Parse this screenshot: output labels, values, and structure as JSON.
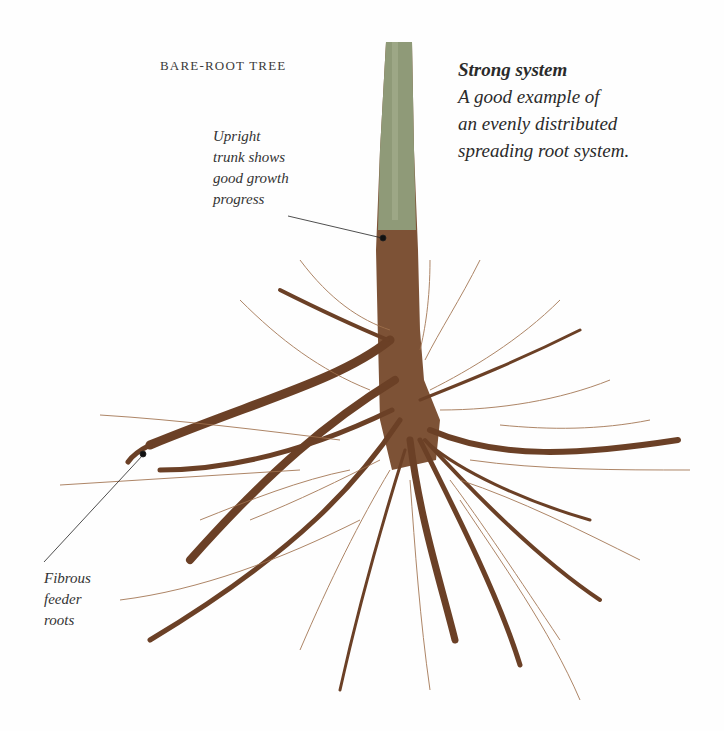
{
  "figure": {
    "heading": "BARE-ROOT TREE",
    "caption": {
      "title": "Strong system",
      "lines": [
        "A good example of",
        "an evenly distributed",
        "spreading root system."
      ]
    },
    "annotations": [
      {
        "id": "trunk",
        "lines": [
          "Upright",
          "trunk shows",
          "good growth",
          "progress"
        ]
      },
      {
        "id": "feeder",
        "lines": [
          "Fibrous",
          "feeder",
          "roots"
        ]
      }
    ],
    "colors": {
      "background": "#fefefe",
      "trunk_upper": "#8f9a78",
      "trunk_lower": "#7a4a2c",
      "root": "#6b4026",
      "fine_root": "#a0714d",
      "text": "#2b2b2b"
    }
  }
}
